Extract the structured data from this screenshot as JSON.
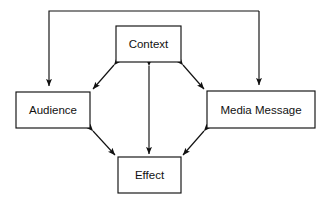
{
  "diagram": {
    "background_color": "#ffffff",
    "line_color": "#111111",
    "nodes": [
      {
        "id": "context",
        "label": "Context",
        "x": 116,
        "y": 26,
        "width": 65,
        "height": 36,
        "cx": 148.5,
        "cy": 44
      },
      {
        "id": "audience",
        "label": "Audience",
        "x": 16,
        "y": 92,
        "width": 74,
        "height": 36,
        "cx": 53,
        "cy": 110
      },
      {
        "id": "media-message",
        "label": "Media Message",
        "x": 207,
        "y": 91,
        "width": 108,
        "height": 37,
        "cx": 261,
        "cy": 109.5
      },
      {
        "id": "effect",
        "label": "Effect",
        "x": 118,
        "y": 157,
        "width": 63,
        "height": 36,
        "cx": 149.5,
        "cy": 175
      }
    ],
    "links": [
      {
        "id": "context-audience",
        "from": "context",
        "to": "audience",
        "arrows": "both",
        "kind": "diagonal",
        "x1": 116,
        "y1": 63,
        "x2": 90.5,
        "y2": 92
      },
      {
        "id": "context-media-message",
        "from": "context",
        "to": "media-message",
        "arrows": "both",
        "kind": "diagonal",
        "x1": 181,
        "y1": 63,
        "x2": 206.5,
        "y2": 91
      },
      {
        "id": "audience-effect",
        "from": "audience",
        "to": "effect",
        "arrows": "both",
        "kind": "diagonal",
        "x1": 90.5,
        "y1": 128,
        "x2": 118,
        "y2": 157
      },
      {
        "id": "media-message-effect",
        "from": "media-message",
        "to": "effect",
        "arrows": "both",
        "kind": "diagonal",
        "x1": 206.5,
        "y1": 128,
        "x2": 181,
        "y2": 157
      },
      {
        "id": "context-effect",
        "from": "context",
        "to": "effect",
        "arrows": "both",
        "kind": "vertical",
        "x1": 149,
        "y1": 63,
        "x2": 149,
        "y2": 157
      }
    ],
    "feedback": [
      {
        "id": "feedback-to-audience",
        "label": "",
        "arrows": "end",
        "points": "49,92 49,11 259,11",
        "target": "audience",
        "arrow_x": 49,
        "arrow_y": 92
      },
      {
        "id": "feedback-to-media-message",
        "label": "",
        "arrows": "end",
        "points": "259,11 259,91",
        "target": "media-message",
        "arrow_x": 259,
        "arrow_y": 91
      }
    ]
  }
}
